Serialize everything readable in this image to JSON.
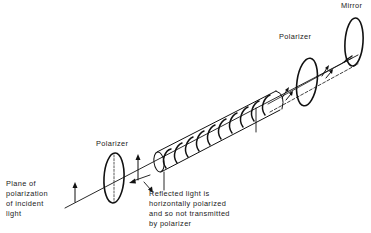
{
  "diagram": {
    "type": "optical-schematic",
    "labels": {
      "mirror": "Mirror",
      "polarizer_right": "Polarizer",
      "polarizer_left": "Polarizer",
      "plane_of_polarization": {
        "line1": "Plane of",
        "line2": "polarization",
        "line3": "of incident",
        "line4": "light"
      },
      "reflected_light": {
        "line1": "Reflected light is",
        "line2": "horizontally polarized",
        "line3": "and so not transmitted",
        "line4": "by polarizer"
      }
    },
    "components": [
      {
        "id": "left-polarizer",
        "kind": "ellipse-polarizer"
      },
      {
        "id": "coiled-tube",
        "kind": "helical-coil-tube",
        "turns": 9
      },
      {
        "id": "right-polarizer",
        "kind": "ellipse-polarizer"
      },
      {
        "id": "end-mirror",
        "kind": "ellipse-mirror"
      }
    ],
    "colors": {
      "stroke": "#111111",
      "text": "#222222",
      "background": "#ffffff"
    }
  }
}
